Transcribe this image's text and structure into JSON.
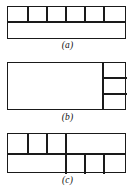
{
  "figure": {
    "background_color": "#ffffff",
    "line_color": "#1a1a1a",
    "panel_count": 3
  },
  "panels": [
    {
      "id": "a",
      "caption": "(a)",
      "description": "Rectangle split by one horizontal line; the upper band is divided into six equal cells, the lower band is a single undivided region.",
      "outer": {
        "x": 7,
        "y": 6,
        "width": 119,
        "height": 33
      },
      "rows": [
        {
          "name": "top-band",
          "height": 14,
          "cells": 6
        },
        {
          "name": "bottom-band",
          "height": 19,
          "cells": 1
        }
      ],
      "total_regions": 7
    },
    {
      "id": "b",
      "caption": "(b)",
      "description": "Rectangle split by one vertical line; the left region is a single large cell, the right narrow column is divided into three stacked cells.",
      "outer": {
        "x": 7,
        "y": 62,
        "width": 119,
        "height": 48
      },
      "columns": [
        {
          "name": "left-region",
          "width": 94,
          "cells": 1
        },
        {
          "name": "right-column",
          "width": 25,
          "cells": 3
        }
      ],
      "total_regions": 4
    },
    {
      "id": "c",
      "caption": "(c)",
      "description": "Rectangle split by one horizontal line; the top band has three small cells on the left plus one wide cell on the right, the bottom band has one wide cell on the left plus three small cells on the right.",
      "outer": {
        "x": 7,
        "y": 133,
        "width": 119,
        "height": 40
      },
      "rows": [
        {
          "name": "top-band",
          "height": 19,
          "cells": 4,
          "cell_widths": [
            19,
            19,
            19,
            62
          ]
        },
        {
          "name": "bottom-band",
          "height": 21,
          "cells": 4,
          "cell_widths": [
            57,
            19,
            19,
            24
          ]
        }
      ],
      "total_regions": 8
    }
  ]
}
